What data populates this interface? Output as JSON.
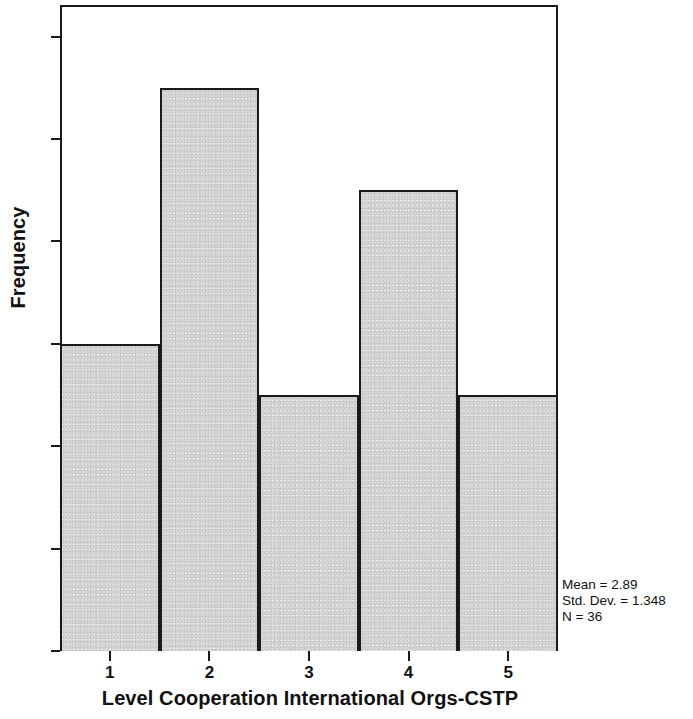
{
  "chart_data": {
    "type": "bar",
    "title": "",
    "subtitle": "",
    "xlabel": "Level Cooperation International Orgs-CSTP",
    "ylabel": "Frequency",
    "categories": [
      "1",
      "2",
      "3",
      "4",
      "5"
    ],
    "values": [
      6,
      11,
      5,
      9,
      5
    ],
    "xtick_labels": [
      "1",
      "2",
      "3",
      "4",
      "5"
    ],
    "ytick_labels": [
      "0",
      "2",
      "4",
      "6",
      "8",
      "10",
      "12"
    ],
    "ytick_values": [
      0,
      2,
      4,
      6,
      8,
      10,
      12
    ],
    "ylim": [
      0,
      12.6
    ],
    "xlim": [
      0.5,
      5.5
    ],
    "grid": false,
    "legend": false,
    "bar_fill_color": "#d4d4d4",
    "bar_edge_color": "#1a1a1a",
    "frame_color": "#1a1a1a",
    "background_color": "#ffffff"
  },
  "annotations": {
    "stats": [
      "Mean = 2.89",
      "Std. Dev. = 1.348",
      "N = 36"
    ],
    "mean": "2.89",
    "std_dev": "1.348",
    "n": "36"
  }
}
